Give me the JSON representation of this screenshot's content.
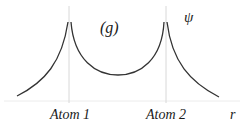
{
  "diagram": {
    "title_label": "(g)",
    "y_label": "ψ",
    "x_label": "r",
    "atoms": [
      {
        "label": "Atom 1"
      },
      {
        "label": "Atom 2"
      }
    ],
    "colors": {
      "curve": "#333333",
      "guide": "#d8d8d8",
      "axis": "#ececec",
      "text": "#1a1a1a"
    }
  }
}
